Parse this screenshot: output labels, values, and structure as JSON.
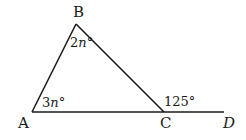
{
  "diagram": {
    "type": "triangle-exterior-angle",
    "points": [
      {
        "id": "A",
        "label": "A",
        "x": 32,
        "y": 112
      },
      {
        "id": "B",
        "label": "B",
        "x": 76,
        "y": 24
      },
      {
        "id": "C",
        "label": "C",
        "x": 164,
        "y": 112
      },
      {
        "id": "D",
        "label": "D",
        "x": 224,
        "y": 112
      }
    ],
    "segments": [
      [
        "A",
        "B"
      ],
      [
        "B",
        "C"
      ],
      [
        "A",
        "D"
      ]
    ],
    "angles": {
      "B": {
        "coef": "2",
        "var": "n",
        "unit": "°"
      },
      "A": {
        "coef": "3",
        "var": "n",
        "unit": "°"
      },
      "BCD": {
        "value": "125°"
      }
    },
    "line_color": "#1a1a1a"
  }
}
